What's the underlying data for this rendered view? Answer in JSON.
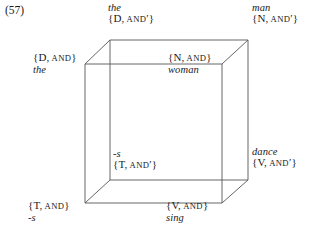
{
  "figure": {
    "example_number": "(57)",
    "line_color": "#555555",
    "text_color": "#1a1a1a",
    "background": "#ffffff"
  },
  "diagram": {
    "type": "cube-lattice",
    "vertices": [
      {
        "id": "back-top-left",
        "position": "back-top-left",
        "word": "the",
        "feature_open": "{",
        "category": "D",
        "comma": ",",
        "operator": "AND",
        "prime": "′",
        "feature_close": "}",
        "feature_label": "{D, AND′}",
        "word_first": true
      },
      {
        "id": "back-top-right",
        "position": "back-top-right",
        "word": "man",
        "feature_open": "{",
        "category": "N",
        "comma": ",",
        "operator": "AND",
        "prime": "′",
        "feature_close": "}",
        "feature_label": "{N, AND′}",
        "word_first": true
      },
      {
        "id": "front-top-left",
        "position": "front-top-left",
        "word": "the",
        "feature_open": "{",
        "category": "D",
        "comma": ",",
        "operator": "AND",
        "prime": "",
        "feature_close": "}",
        "feature_label": "{D, AND}",
        "word_first": false
      },
      {
        "id": "front-top-right",
        "position": "front-top-right",
        "word": "woman",
        "feature_open": "{",
        "category": "N",
        "comma": ",",
        "operator": "AND",
        "prime": "",
        "feature_close": "}",
        "feature_label": "{N, AND}",
        "word_first": false
      },
      {
        "id": "back-bottom-left",
        "position": "back-bottom-left",
        "word": "-s",
        "feature_open": "{",
        "category": "T",
        "comma": ",",
        "operator": "AND",
        "prime": "′",
        "feature_close": "}",
        "feature_label": "{T, AND′}",
        "word_first": true
      },
      {
        "id": "back-bottom-right",
        "position": "back-bottom-right",
        "word": "dance",
        "feature_open": "{",
        "category": "V",
        "comma": ",",
        "operator": "AND",
        "prime": "′",
        "feature_close": "}",
        "feature_label": "{V, AND′}",
        "word_first": true
      },
      {
        "id": "front-bottom-left",
        "position": "front-bottom-left",
        "word": "-s",
        "feature_open": "{",
        "category": "T",
        "comma": ",",
        "operator": "AND",
        "prime": "",
        "feature_close": "}",
        "feature_label": "{T, AND}",
        "word_first": false
      },
      {
        "id": "front-bottom-right",
        "position": "front-bottom-right",
        "word": "sing",
        "feature_open": "{",
        "category": "V",
        "comma": ",",
        "operator": "AND",
        "prime": "",
        "feature_close": "}",
        "feature_label": "{V, AND}",
        "word_first": false
      }
    ]
  }
}
